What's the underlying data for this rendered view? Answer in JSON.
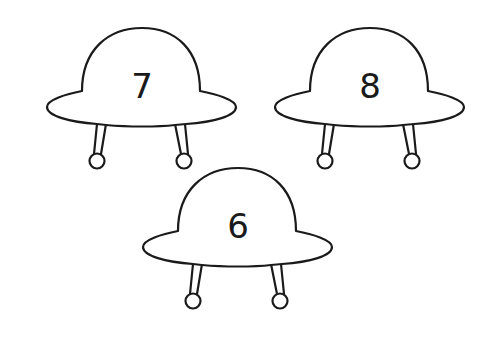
{
  "ufos": [
    {
      "number": "7",
      "x": 0,
      "y": 0
    },
    {
      "number": "8",
      "x": 232,
      "y": 0
    },
    {
      "number": "6",
      "x": 104,
      "y": 140
    }
  ],
  "colors": {
    "stroke": "#1a1a1a",
    "background": "#ffffff"
  }
}
